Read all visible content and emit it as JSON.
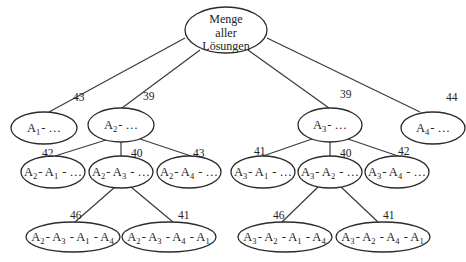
{
  "diagram": {
    "type": "branch-and-bound-tree",
    "root": {
      "id": "root",
      "label_lines": [
        "Menge",
        "aller",
        "Lösungen"
      ]
    },
    "nodes": [
      {
        "id": "A1",
        "parent": "root",
        "cost": "43",
        "label": [
          [
            "A",
            "1"
          ],
          [
            "- …",
            ""
          ]
        ]
      },
      {
        "id": "A2",
        "parent": "root",
        "cost": "39",
        "label": [
          [
            "A",
            "2"
          ],
          [
            "- …",
            ""
          ]
        ]
      },
      {
        "id": "A3",
        "parent": "root",
        "cost": "39",
        "label": [
          [
            "A",
            "3"
          ],
          [
            "- …",
            ""
          ]
        ]
      },
      {
        "id": "A4",
        "parent": "root",
        "cost": "44",
        "label": [
          [
            "A",
            "4"
          ],
          [
            "- …",
            ""
          ]
        ]
      },
      {
        "id": "A2A1",
        "parent": "A2",
        "cost": "42",
        "label": [
          [
            "A",
            "2"
          ],
          [
            "- ",
            ""
          ],
          [
            "A",
            "1"
          ],
          [
            " - …",
            ""
          ]
        ]
      },
      {
        "id": "A2A3",
        "parent": "A2",
        "cost": "40",
        "label": [
          [
            "A",
            "2"
          ],
          [
            "- ",
            ""
          ],
          [
            "A",
            "3"
          ],
          [
            " - …",
            ""
          ]
        ]
      },
      {
        "id": "A2A4",
        "parent": "A2",
        "cost": "43",
        "label": [
          [
            "A",
            "2"
          ],
          [
            "- ",
            ""
          ],
          [
            "A",
            "4"
          ],
          [
            " - …",
            ""
          ]
        ]
      },
      {
        "id": "A3A1",
        "parent": "A3",
        "cost": "41",
        "label": [
          [
            "A",
            "3"
          ],
          [
            "- ",
            ""
          ],
          [
            "A",
            "1"
          ],
          [
            " - …",
            ""
          ]
        ]
      },
      {
        "id": "A3A2",
        "parent": "A3",
        "cost": "40",
        "label": [
          [
            "A",
            "3"
          ],
          [
            "- ",
            ""
          ],
          [
            "A",
            "2"
          ],
          [
            " - …",
            ""
          ]
        ]
      },
      {
        "id": "A3A4",
        "parent": "A3",
        "cost": "42",
        "label": [
          [
            "A",
            "3"
          ],
          [
            "- ",
            ""
          ],
          [
            "A",
            "4"
          ],
          [
            " - …",
            ""
          ]
        ]
      },
      {
        "id": "A2A3A1A4",
        "parent": "A2A3",
        "cost": "46",
        "label": [
          [
            "A",
            "2"
          ],
          [
            "- ",
            ""
          ],
          [
            "A",
            "3"
          ],
          [
            " - ",
            ""
          ],
          [
            "A",
            "1"
          ],
          [
            " - ",
            ""
          ],
          [
            "A",
            "4"
          ]
        ]
      },
      {
        "id": "A2A3A4A1",
        "parent": "A2A3",
        "cost": "41",
        "label": [
          [
            "A",
            "2"
          ],
          [
            "- ",
            ""
          ],
          [
            "A",
            "3"
          ],
          [
            " - ",
            ""
          ],
          [
            "A",
            "4"
          ],
          [
            " - ",
            ""
          ],
          [
            "A",
            "1"
          ]
        ]
      },
      {
        "id": "A3A2A1A4",
        "parent": "A3A2",
        "cost": "46",
        "label": [
          [
            "A",
            "3"
          ],
          [
            "- ",
            ""
          ],
          [
            "A",
            "2"
          ],
          [
            " - ",
            ""
          ],
          [
            "A",
            "1"
          ],
          [
            " - ",
            ""
          ],
          [
            "A",
            "4"
          ]
        ]
      },
      {
        "id": "A3A2A4A1",
        "parent": "A3A2",
        "cost": "41",
        "label": [
          [
            "A",
            "3"
          ],
          [
            "- ",
            ""
          ],
          [
            "A",
            "2"
          ],
          [
            " - ",
            ""
          ],
          [
            "A",
            "4"
          ],
          [
            " - ",
            ""
          ],
          [
            "A",
            "1"
          ]
        ]
      }
    ]
  }
}
